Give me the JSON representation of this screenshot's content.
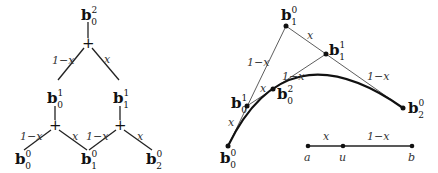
{
  "tree": {
    "top": {
      "base": "b",
      "sub": "0",
      "sup": "2"
    },
    "mid": [
      {
        "base": "b",
        "sub": "0",
        "sup": "1"
      },
      {
        "base": "b",
        "sub": "1",
        "sup": "1"
      }
    ],
    "bottom": [
      {
        "base": "b",
        "sub": "0",
        "sup": "0"
      },
      {
        "base": "b",
        "sub": "1",
        "sup": "0"
      },
      {
        "base": "b",
        "sub": "2",
        "sup": "0"
      }
    ],
    "plus": "+",
    "weight_left": "1−x",
    "weight_right": "x"
  },
  "curve": {
    "points": [
      {
        "id": "b00",
        "base": "b",
        "sub": "0",
        "sup": "0"
      },
      {
        "id": "b10",
        "base": "b",
        "sub": "1",
        "sup": "0"
      },
      {
        "id": "b20",
        "base": "b",
        "sub": "2",
        "sup": "0"
      },
      {
        "id": "b01",
        "base": "b",
        "sub": "0",
        "sup": "1"
      },
      {
        "id": "b11",
        "base": "b",
        "sub": "1",
        "sup": "1"
      },
      {
        "id": "b02",
        "base": "b",
        "sub": "0",
        "sup": "2"
      }
    ],
    "weight_left": "1−x",
    "weight_right": "x"
  },
  "segment": {
    "a": "a",
    "u": "u",
    "b": "b",
    "left_weight": "x",
    "right_weight": "1−x"
  }
}
